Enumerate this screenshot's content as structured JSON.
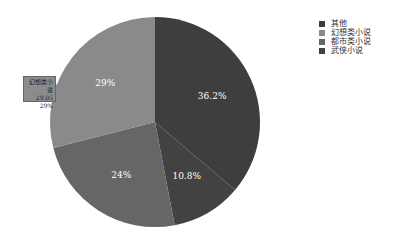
{
  "chart_data": {
    "type": "pie",
    "title": "",
    "categories": [
      "其他",
      "幻想类小说",
      "都市类小说",
      "武侠小说"
    ],
    "values": [
      36.2,
      29,
      24,
      10.8
    ],
    "labels": [
      "36.2%",
      "29%",
      "24%",
      "10.8%"
    ],
    "colors": [
      "#3e3e3e",
      "#8a8a8a",
      "#666666",
      "#424242"
    ],
    "legend_position": "right",
    "tooltip": {
      "name": "幻想类小说",
      "value": "29.05",
      "percent": "29%"
    }
  },
  "legend": {
    "items": [
      {
        "label": "其他",
        "color": "#3e3e3e"
      },
      {
        "label": "幻想类小说",
        "color": "#8a8a8a"
      },
      {
        "label": "都市类小说",
        "color": "#666666"
      },
      {
        "label": "武侠小说",
        "color": "#424242"
      }
    ]
  },
  "tooltip": {
    "name": "幻想类小说",
    "value": "29.05",
    "percent": "29%"
  }
}
